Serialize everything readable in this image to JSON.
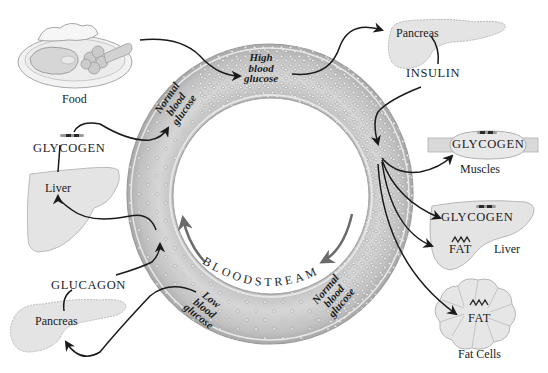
{
  "diagram": {
    "center_label": "BLOODSTREAM",
    "ring_states": [
      {
        "id": "high",
        "lines": [
          "High",
          "blood",
          "glucose"
        ]
      },
      {
        "id": "normal_left",
        "lines": [
          "Normal",
          "blood",
          "glucose"
        ]
      },
      {
        "id": "normal_right",
        "lines": [
          "Normal",
          "blood",
          "glucose"
        ]
      },
      {
        "id": "low",
        "lines": [
          "Low",
          "blood",
          "glucose"
        ]
      }
    ],
    "nodes": {
      "food": "Food",
      "pancreas_top": "Pancreas",
      "insulin": "INSULIN",
      "muscles_glycogen": "GLYCOGEN",
      "muscles": "Muscles",
      "liver_right_glycogen": "GLYCOGEN",
      "liver_right_fat": "FAT",
      "liver_right": "Liver",
      "fat_cells_fat": "FAT",
      "fat_cells": "Fat Cells",
      "glycogen_left": "GLYCOGEN",
      "liver_left": "Liver",
      "glucagon": "GLUCAGON",
      "pancreas_bottom": "Pancreas"
    },
    "colors": {
      "ring_fill": "#c9c9c9",
      "ring_edge": "#9a9a9a",
      "organ_fill": "#e4e4e4",
      "organ_edge": "#b8b8b8",
      "arrow": "#1a1a1a",
      "flow_arrow": "#6b6b6b"
    }
  }
}
